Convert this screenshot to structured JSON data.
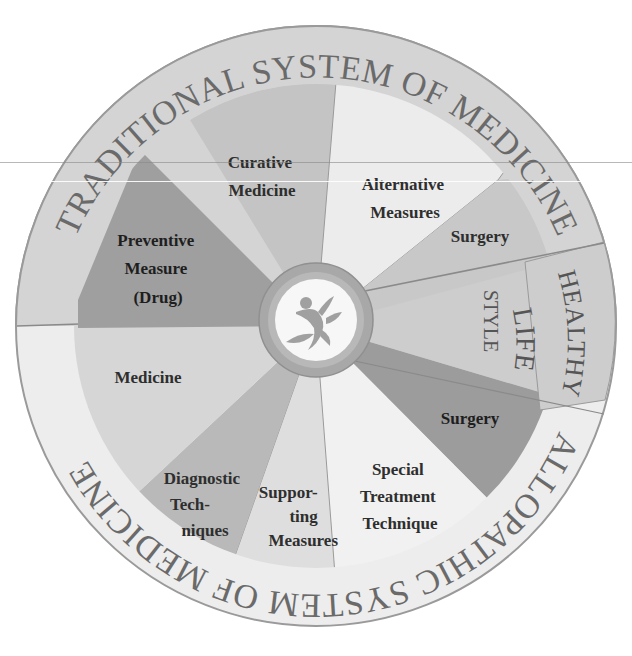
{
  "diagram": {
    "title_ring_top": "TRADITIONAL SYSTEM OF MEDICINE",
    "title_ring_bottom": "ALLOPATHIC SYSTEM OF MEDICINE",
    "healthy_lifestyle": {
      "line1": "HEALTHY",
      "line2": "LIFE",
      "line3": "STYLE"
    },
    "center_icon": "dancing-figure-with-leaves-icon",
    "segments": [
      {
        "id": "curative-medicine",
        "lines": [
          "Curative",
          "Medicine"
        ],
        "system": "traditional",
        "color": "#c4c4c4"
      },
      {
        "id": "alternative-measures",
        "lines": [
          "Alternative",
          "Measures"
        ],
        "system": "traditional",
        "color": "#ececec"
      },
      {
        "id": "surgery-traditional",
        "lines": [
          "Surgery"
        ],
        "system": "traditional",
        "color": "#c8c8c8"
      },
      {
        "id": "healthy-life-style",
        "lines": [
          "LIFE",
          "STYLE"
        ],
        "system": "shared",
        "color": "#cdcdcd"
      },
      {
        "id": "surgery-allopathic",
        "lines": [
          "Surgery"
        ],
        "system": "allopathic",
        "color": "#9c9c9c"
      },
      {
        "id": "special-treatment-technique",
        "lines": [
          "Special",
          "Treatment",
          "Technique"
        ],
        "system": "allopathic",
        "color": "#f1f1f1"
      },
      {
        "id": "supporting-measures",
        "lines": [
          "Suppor-",
          "ting",
          "Measures"
        ],
        "system": "allopathic",
        "color": "#dedede"
      },
      {
        "id": "diagnostic-techniques",
        "lines": [
          "Diagnostic",
          "Tech-",
          "niques"
        ],
        "system": "allopathic",
        "color": "#b9b9b9"
      },
      {
        "id": "medicine",
        "lines": [
          "Medicine"
        ],
        "system": "allopathic",
        "color": "#d6d6d6"
      },
      {
        "id": "preventive-measure-drug",
        "lines": [
          "Preventive",
          "Measure",
          "(Drug)"
        ],
        "system": "traditional",
        "color": "#9f9f9f"
      }
    ],
    "colors": {
      "ring_upper": "#d4d4d4",
      "ring_lower": "#ededed",
      "outline": "#9a9a9a",
      "hub_ring": "#a8a8a8",
      "hub_inner": "#f7f7f7",
      "text": "#2e2e2e",
      "ring_text": "#6a6a6a"
    }
  }
}
